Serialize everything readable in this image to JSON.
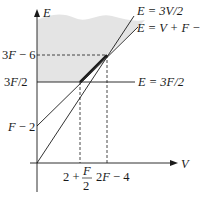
{
  "diagram": {
    "axes": {
      "y_label": "E",
      "x_label": "V"
    },
    "y_ticks": [
      {
        "label_pre": "3",
        "label_var": "F",
        "label_post": " − 6",
        "id": "3F-6"
      },
      {
        "label_pre": "3",
        "label_var": "F",
        "label_post": "/2",
        "id": "3F/2"
      },
      {
        "label_pre": "",
        "label_var": "F",
        "label_post": " − 2",
        "id": "F-2"
      }
    ],
    "x_ticks": [
      {
        "text": "2 +",
        "frac_num": "F",
        "frac_den": "2",
        "id": "2+F/2"
      },
      {
        "label_pre": "2",
        "label_var": "F",
        "label_post": " − 4",
        "id": "2F-4"
      }
    ],
    "lines": [
      {
        "id": "E=3V/2",
        "label": "E = 3V/2"
      },
      {
        "id": "E=V+F-2",
        "label": "E = V + F − 2"
      },
      {
        "id": "E=3F/2",
        "label": "E = 3F/2"
      }
    ],
    "colors": {
      "shade": "#e4e4e4",
      "ink": "#1a1a1a"
    }
  }
}
